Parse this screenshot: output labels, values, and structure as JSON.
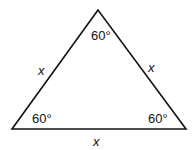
{
  "diagram": {
    "type": "equilateral-triangle",
    "stroke_color": "#111111",
    "background": "#ffffff",
    "vertices": {
      "top": {
        "x": 98,
        "y": 10
      },
      "bottom_left": {
        "x": 12,
        "y": 129
      },
      "bottom_right": {
        "x": 186,
        "y": 129
      }
    },
    "angles": {
      "top": "60°",
      "bottom_left": "60°",
      "bottom_right": "60°"
    },
    "sides": {
      "left": "x",
      "right": "x",
      "bottom": "x"
    }
  }
}
